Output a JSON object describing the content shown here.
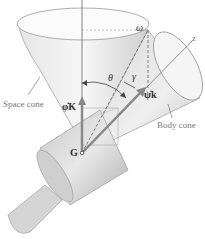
{
  "diagram": {
    "type": "rigid-body precession (space cone / body cone)",
    "labels": {
      "space_cone": "Space cone",
      "body_cone": "Body cone",
      "omega": "ω",
      "theta": "θ",
      "gamma": "γ",
      "phi_dot_K": "φ̇K",
      "psi_dot_k": "ψ̇k",
      "z_axis": "z",
      "center_of_mass": "G"
    },
    "colors": {
      "cone_fill_light": "#f2f2f2",
      "cone_fill_mid": "#d9d9d9",
      "cone_fill_dark": "#b8b8b8",
      "outline": "#888888",
      "axis": "#666666",
      "vector": "#8a8a8a",
      "background": "#ffffff"
    }
  }
}
